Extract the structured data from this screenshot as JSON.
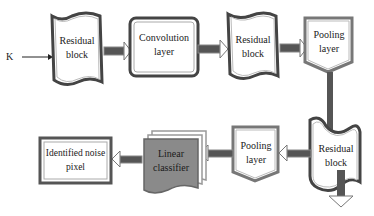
{
  "diagram": {
    "input_label": "K",
    "nodes": [
      {
        "id": "residual-block-1",
        "label_line1": "Residual",
        "label_line2": "block"
      },
      {
        "id": "convolution-layer",
        "label_line1": "Convolution",
        "label_line2": "layer"
      },
      {
        "id": "residual-block-2",
        "label_line1": "Residual",
        "label_line2": "block"
      },
      {
        "id": "pooling-layer-1",
        "label_line1": "Pooling",
        "label_line2": "layer"
      },
      {
        "id": "residual-block-3",
        "label_line1": "Residual",
        "label_line2": "block"
      },
      {
        "id": "pooling-layer-2",
        "label_line1": "Pooling",
        "label_line2": "layer"
      },
      {
        "id": "linear-classifier",
        "label_line1": "Linear",
        "label_line2": "classifier"
      },
      {
        "id": "identified-noise-pixel",
        "label_line1": "Identified noise",
        "label_line2": "pixel"
      }
    ],
    "colors": {
      "arrow": "#555555",
      "border": "#444444",
      "linear_fill": "#8a8a8a",
      "background": "#ffffff"
    }
  }
}
